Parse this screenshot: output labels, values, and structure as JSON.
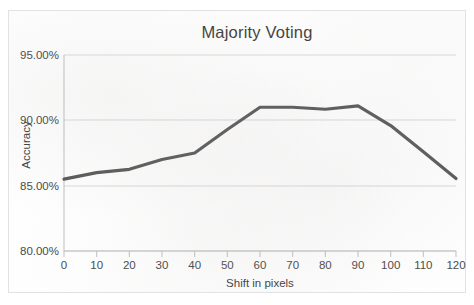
{
  "chart_data": {
    "type": "line",
    "title": "Majority Voting",
    "xlabel": "Shift in pixels",
    "ylabel": "Accuracy",
    "x": [
      0,
      10,
      20,
      30,
      40,
      50,
      60,
      70,
      80,
      90,
      100,
      110,
      120
    ],
    "values": [
      85.5,
      86.0,
      86.25,
      87.0,
      87.5,
      89.3,
      91.0,
      91.0,
      90.85,
      91.1,
      89.6,
      87.6,
      85.55
    ],
    "series": [
      {
        "name": "Majority Voting",
        "values": [
          85.5,
          86.0,
          86.25,
          87.0,
          87.5,
          89.3,
          91.0,
          91.0,
          90.85,
          91.1,
          89.6,
          87.6,
          85.55
        ]
      }
    ],
    "xlim": [
      0,
      120
    ],
    "ylim": [
      80,
      95
    ],
    "x_tick_labels": [
      "0",
      "10",
      "20",
      "30",
      "40",
      "50",
      "60",
      "70",
      "80",
      "90",
      "100",
      "110",
      "120"
    ],
    "y_tick_labels": [
      "80.00%",
      "85.00%",
      "90.00%",
      "95.00%"
    ],
    "y_ticks": [
      80,
      85,
      90,
      95
    ],
    "grid": true,
    "legend": false,
    "line_color": "#595959",
    "grid_color": "#d9d9d9",
    "axis_color": "#bfbfbf"
  }
}
